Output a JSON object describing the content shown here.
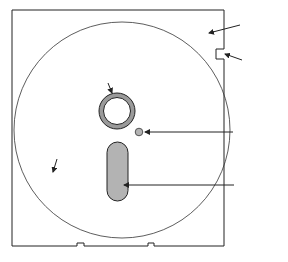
{
  "diagram": {
    "labels": {
      "jacket": "Jacket",
      "write_protect_1": "Write",
      "write_protect_2": "Protect",
      "write_protect_3": "Notch",
      "hub_1": "Hub",
      "hub_2": "Opening",
      "index_hole": "Index Hole",
      "disk": "Disk",
      "read_write_1": "Read-Write",
      "read_write_2": "Opening",
      "stress_relief": "Stress-Relief Notches"
    },
    "colors": {
      "line": "#222222",
      "hub_ring": "#9a9a9a",
      "opening_fill": "#b3b3b3",
      "background": "#ffffff"
    }
  }
}
